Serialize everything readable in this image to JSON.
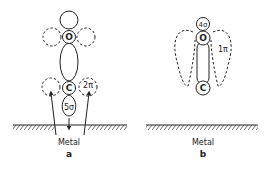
{
  "panel_a": {
    "atom_top": "O",
    "atom_bottom": "C",
    "orbital_sigma": "5σ",
    "orbital_pi": "2π",
    "surface": "Metal",
    "label": "a"
  },
  "panel_b": {
    "atom_top": "O",
    "atom_bottom": "C",
    "orbital_sigma": "4σ",
    "orbital_pi": "1π",
    "surface": "Metal",
    "label": "b"
  },
  "colors": {
    "line": "#222222",
    "background": "#ffffff"
  }
}
